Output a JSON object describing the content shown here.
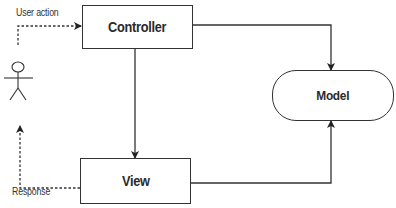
{
  "diagram": {
    "type": "MVC architecture flow",
    "nodes": {
      "controller": {
        "label": "Controller"
      },
      "view": {
        "label": "View"
      },
      "model": {
        "label": "Model"
      },
      "user": {
        "icon": "stick-figure-actor-icon"
      }
    },
    "edges": [
      {
        "from": "user",
        "to": "controller",
        "label": "User action",
        "style": "dashed"
      },
      {
        "from": "controller",
        "to": "model",
        "label": "",
        "style": "solid"
      },
      {
        "from": "controller",
        "to": "view",
        "label": "",
        "style": "solid"
      },
      {
        "from": "view",
        "to": "model",
        "label": "",
        "style": "solid"
      },
      {
        "from": "view",
        "to": "user",
        "label": "Response",
        "style": "dashed"
      }
    ],
    "colors": {
      "stroke": "#333333",
      "text": "#2a2a2a",
      "background": "#ffffff"
    }
  }
}
